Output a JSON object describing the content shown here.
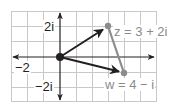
{
  "diagram": {
    "type": "complex-plane-vector-addition",
    "grid": {
      "x_min": -3,
      "x_max": 6,
      "y_min": -3,
      "y_max": 3,
      "unit_px_x": 16,
      "unit_px_y": 15.3
    },
    "axis_labels": {
      "real_neg": "−2",
      "imag_pos": "2i",
      "imag_neg": "−2i"
    },
    "points": {
      "origin": {
        "re": 0,
        "im": 0
      },
      "z": {
        "re": 3,
        "im": 2,
        "label": "z = 3 + 2i"
      },
      "w": {
        "re": 4,
        "im": -1,
        "label": "w = 4 − i"
      }
    },
    "colors": {
      "grid": "#c8c8c8",
      "axis": "#231f20",
      "vector": "#231f20",
      "connector": "#8c8c8c",
      "label_gray": "#8a8a8a"
    }
  }
}
